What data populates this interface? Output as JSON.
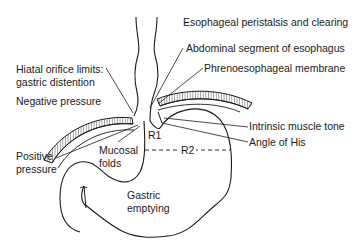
{
  "diagram": {
    "type": "anatomical-diagram",
    "line_color": "#1a1a1a",
    "background": "#ffffff",
    "labels": {
      "peristalsis": "Esophageal peristalsis and clearing",
      "abdominal_segment": "Abdominal segment of esophagus",
      "phrenoesophageal": "Phrenoesophageal membrane",
      "hiatal_line1": "Hiatal orifice limits:",
      "hiatal_line2": "gastric distention",
      "negative_pressure": "Negative pressure",
      "positive_line1": "Positive",
      "positive_line2": "pressure",
      "mucosal_line1": "Mucosal",
      "mucosal_line2": "folds",
      "r1": "R1",
      "r2": "R2",
      "intrinsic_tone": "Intrinsic muscle tone",
      "angle_of_his": "Angle of His",
      "gastric_line1": "Gastric",
      "gastric_line2": "emptying"
    }
  }
}
